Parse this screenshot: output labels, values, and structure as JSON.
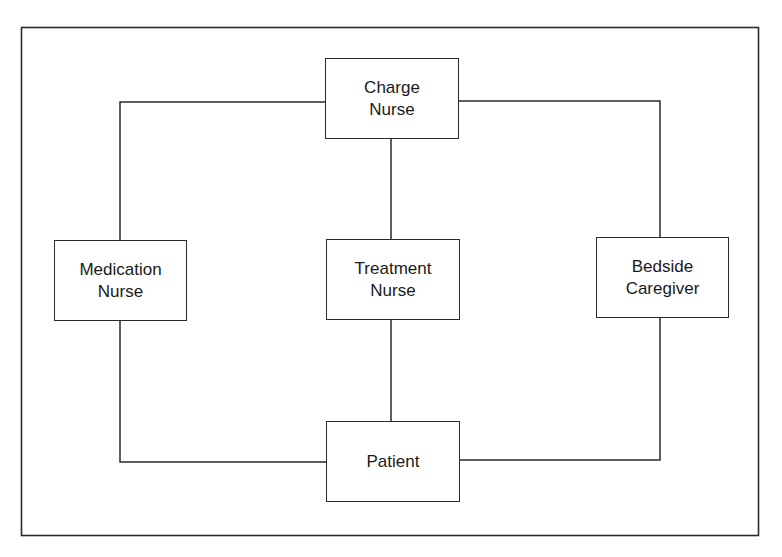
{
  "diagram": {
    "type": "organizational-flow",
    "colors": {
      "line": "#2a2a2a",
      "background": "#ffffff",
      "text": "#1a1a1a"
    },
    "nodes": {
      "charge_nurse": {
        "line1": "Charge",
        "line2": "Nurse"
      },
      "medication_nurse": {
        "line1": "Medication",
        "line2": "Nurse"
      },
      "treatment_nurse": {
        "line1": "Treatment",
        "line2": "Nurse"
      },
      "bedside_caregiver": {
        "line1": "Bedside",
        "line2": "Caregiver"
      },
      "patient": {
        "line1": "Patient"
      }
    },
    "edges": [
      {
        "from": "Charge Nurse",
        "to": "Medication Nurse"
      },
      {
        "from": "Charge Nurse",
        "to": "Treatment Nurse"
      },
      {
        "from": "Charge Nurse",
        "to": "Bedside Caregiver"
      },
      {
        "from": "Medication Nurse",
        "to": "Patient"
      },
      {
        "from": "Treatment Nurse",
        "to": "Patient"
      },
      {
        "from": "Bedside Caregiver",
        "to": "Patient"
      }
    ]
  }
}
